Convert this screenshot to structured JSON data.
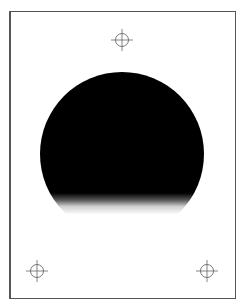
{
  "figure": {
    "background_color": "#ffffff",
    "frame_color": "#555555",
    "disc": {
      "color": "#000000",
      "center_x": 122,
      "center_y": 154,
      "radius": 82,
      "solid_until_y": 193,
      "fade_end_y": 216
    },
    "crosshairs": [
      {
        "name": "top",
        "x": 122,
        "y": 40
      },
      {
        "name": "bottom-left",
        "x": 37,
        "y": 271
      },
      {
        "name": "bottom-right",
        "x": 207,
        "y": 271
      }
    ],
    "crosshair_color": "#666666"
  }
}
